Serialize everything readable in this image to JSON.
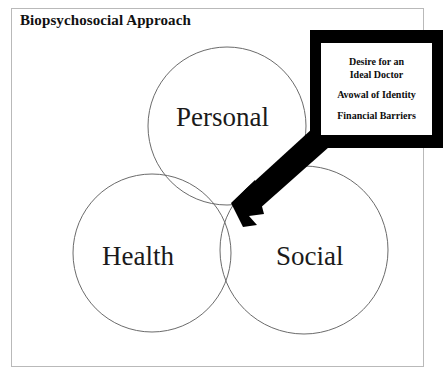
{
  "figure": {
    "title": "Biopsychosocial Approach",
    "background_color": "#ffffff",
    "frame_color": "#b9b9b9"
  },
  "venn": {
    "circle_stroke_color": "#6b6b6b",
    "circles": [
      {
        "id": "personal",
        "label": "Personal",
        "cx": 227,
        "cy": 126,
        "r": 79
      },
      {
        "id": "health",
        "label": "Health",
        "cx": 152,
        "cy": 253,
        "r": 79
      },
      {
        "id": "social",
        "label": "Social",
        "cx": 304,
        "cy": 250,
        "r": 84
      }
    ]
  },
  "callout": {
    "border_color": "#000000",
    "fill_color": "#ffffff",
    "lines": [
      {
        "text": "Desire for an",
        "text2": "Ideal Doctor"
      },
      {
        "text": "Avowal of Identity",
        "text2": ""
      },
      {
        "text": "Financial Barriers",
        "text2": ""
      }
    ],
    "line1_a": "Desire for an",
    "line1_b": "Ideal Doctor",
    "line2": "Avowal of Identity",
    "line3": "Financial Barriers"
  },
  "arrow": {
    "color": "#000000",
    "points_to_label": "Personal-Health-Social overlap",
    "tip_x": 232,
    "tip_y": 203
  }
}
